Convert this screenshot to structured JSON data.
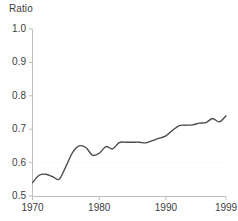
{
  "chart_data": {
    "type": "line",
    "title": "",
    "subtitle": "",
    "ylabel": "Ratio",
    "xlabel": "",
    "xlim": [
      1970,
      1999
    ],
    "ylim": [
      0.5,
      1.0
    ],
    "grid": "faint-horizontal",
    "legend": "none",
    "line_color": "#4a4a4a",
    "axis_color": "#bdbdbd",
    "text_color": "#3d3d3d",
    "ytick_labels": [
      "0.5",
      "0.6",
      "0.7",
      "0.8",
      "0.9",
      "1.0"
    ],
    "ytick_values": [
      0.5,
      0.6,
      0.7,
      0.8,
      0.9,
      1.0
    ],
    "xtick_labels": [
      "1970",
      "1980",
      "1990",
      "1999"
    ],
    "xtick_values": [
      1970,
      1980,
      1990,
      1999
    ],
    "x": [
      1970,
      1971,
      1972,
      1973,
      1974,
      1975,
      1976,
      1977,
      1978,
      1979,
      1980,
      1981,
      1982,
      1983,
      1984,
      1985,
      1986,
      1987,
      1988,
      1989,
      1990,
      1991,
      1992,
      1993,
      1994,
      1995,
      1996,
      1997,
      1998,
      1999
    ],
    "series": [
      {
        "name": "Ratio",
        "values": [
          0.54,
          0.562,
          0.565,
          0.558,
          0.55,
          0.588,
          0.63,
          0.65,
          0.645,
          0.622,
          0.628,
          0.648,
          0.641,
          0.66,
          0.661,
          0.661,
          0.661,
          0.659,
          0.666,
          0.673,
          0.68,
          0.697,
          0.711,
          0.712,
          0.713,
          0.718,
          0.72,
          0.732,
          0.722,
          0.74
        ]
      }
    ]
  }
}
